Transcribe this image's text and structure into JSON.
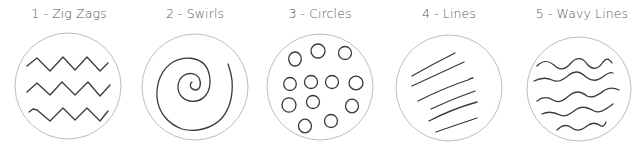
{
  "panels": [
    {
      "label": "1 - Zig Zags",
      "pattern": "zig-zags",
      "center_x": 69
    },
    {
      "label": "2 - Swirls",
      "pattern": "swirls",
      "center_x": 195
    },
    {
      "label": "3 - Circles",
      "pattern": "circles",
      "center_x": 320
    },
    {
      "label": "4 - Lines",
      "pattern": "lines",
      "center_x": 449
    },
    {
      "label": "5 - Wavy Lines",
      "pattern": "wavy-lines",
      "center_x": 582
    }
  ],
  "colors": {
    "ink": "#3a3a3a",
    "outline": "#bdbdbd",
    "title": "#5a5a5a",
    "background": "#ffffff"
  }
}
